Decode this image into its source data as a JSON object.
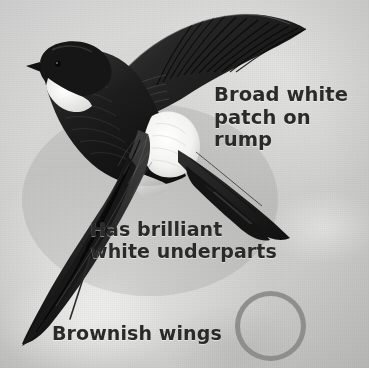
{
  "image": {
    "subject": "house-martin-in-flight",
    "style": "grayscale-field-guide-illustration",
    "width": 369,
    "height": 368
  },
  "background": {
    "base_color": "#d6d6d4",
    "highlight_color": "#dedede",
    "shadow_color": "#c9c9c7"
  },
  "annotations": {
    "rump": {
      "text": "Broad white\npatch on rump",
      "line1": "Broad white",
      "line2": "patch on rump",
      "color": "#2a2a2a"
    },
    "underparts": {
      "text": "Has brilliant\nwhite underparts",
      "line1": "Has brilliant",
      "line2": "white underparts",
      "color": "#2a2a2a"
    },
    "wings": {
      "text": "Brownish wings",
      "color": "#2a2a2a"
    }
  },
  "leader_line": {
    "name": "brownish-wings-leader-line",
    "from_x": 90,
    "from_y": 257,
    "to_x": 70,
    "to_y": 319,
    "color": "#2b2b2b",
    "width": 1.6
  },
  "circle_marker": {
    "name": "circle-annotation",
    "center_x": 271,
    "center_y": 326,
    "radius": 35,
    "stroke_color": "#8a8a88",
    "stroke_width": 5,
    "fill": "none"
  },
  "bird": {
    "body_color": "#1e1e1e",
    "wing_color": "#242424",
    "wing_highlight": "#4a4a4a",
    "white_patch_color": "#f6f6f4",
    "throat_color": "#eeeeec",
    "eye_color": "#0c0c0c",
    "parts": [
      {
        "name": "upper-wing",
        "label": "upper wing raised to upper right"
      },
      {
        "name": "lower-wing",
        "label": "lower wing swept to lower left"
      },
      {
        "name": "head",
        "label": "dark glossy head with small beak"
      },
      {
        "name": "throat-patch",
        "label": "white throat"
      },
      {
        "name": "rump-patch",
        "label": "broad white rump patch"
      },
      {
        "name": "tail",
        "label": "dark forked tail to lower right"
      },
      {
        "name": "eye",
        "label": "eye"
      },
      {
        "name": "beak",
        "label": "short pointed beak"
      }
    ]
  }
}
